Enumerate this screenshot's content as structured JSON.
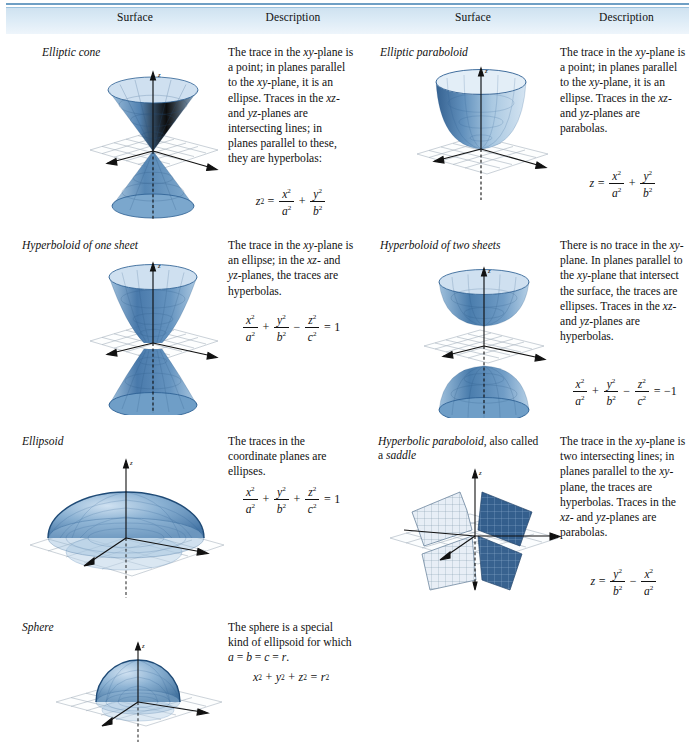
{
  "table": {
    "headers": [
      "Surface",
      "Description",
      "Surface",
      "Description"
    ],
    "rows": [
      {
        "left": {
          "surface_name": "Elliptic cone",
          "figure": "elliptic-cone",
          "description": "The trace in the xy-plane is a point; in planes parallel to the xy-plane, it is an ellipse. Traces in the xz- and yz-planes are intersecting lines; in planes parallel to these, they are hyperbolas:",
          "equation_text": "z² = x²/a² + y²/b²"
        },
        "right": {
          "surface_name": "Elliptic paraboloid",
          "figure": "elliptic-paraboloid",
          "description": "The trace in the xy-plane is a point; in planes parallel to the xy-plane, it is an ellipse. Traces in the xz- and yz-planes are parabolas.",
          "equation_text": "z = x²/a² + y²/b²"
        }
      },
      {
        "left": {
          "surface_name": "Hyperboloid of one sheet",
          "figure": "hyperboloid-one-sheet",
          "description": "The trace in the xy-plane is an ellipse; in the xz- and yz-planes, the traces are hyperbolas.",
          "equation_text": "x²/a² + y²/b² − z²/c² = 1"
        },
        "right": {
          "surface_name": "Hyperboloid of two sheets",
          "figure": "hyperboloid-two-sheets",
          "description": "There is no trace in the xy-plane. In planes parallel to the xy-plane that intersect the surface, the traces are ellipses. Traces in the xz- and yz-planes are hyperbolas.",
          "equation_text": "x²/a² + y²/b² − z²/c² = −1"
        }
      },
      {
        "left": {
          "surface_name": "Ellipsoid",
          "figure": "ellipsoid",
          "description": "The traces in the coordinate planes are ellipses.",
          "equation_text": "x²/a² + y²/b² + z²/c² = 1"
        },
        "right": {
          "surface_name": "Hyperbolic paraboloid, also called a saddle",
          "surface_name_italic": "Hyperbolic paraboloid",
          "surface_name_roman": ", also called",
          "surface_name_line2_roman": "a ",
          "surface_name_line2_italic": "saddle",
          "figure": "hyperbolic-paraboloid",
          "description": "The trace in the xy-plane is two intersecting lines; in planes parallel to the xy-plane, the traces are hyperbolas. Traces in the xz- and yz-planes are parabolas.",
          "equation_text": "z = y²/b² − x²/a²"
        }
      },
      {
        "left": {
          "surface_name": "Sphere",
          "figure": "sphere",
          "description": "The sphere is a special kind of ellipsoid for which a = b = c = r.",
          "equation_text": "x² + y² + z² = r²"
        }
      }
    ]
  },
  "desc_lines": {
    "elliptic_cone": [
      "The trace in the ",
      "xy-",
      "plane is a point; in",
      "planes parallel to the",
      "xy-plane, it is an ellipse.",
      "Traces in the ",
      "xz-",
      " and ",
      "yz-",
      "planes are intersecting",
      "lines; in planes parallel",
      "to these, they are",
      "hyperbolas:"
    ]
  },
  "axis_labels": {
    "x": "x",
    "y": "y",
    "z": "z"
  },
  "colors": {
    "header_gradient_top": "#cfe2f0",
    "header_gradient_bottom": "#eef5fb",
    "header_rule": "#6f9fc4",
    "surface_fill_dark": "#2e5f94",
    "surface_fill_mid": "#6d9dc7",
    "surface_fill_light": "#b9d2e8",
    "grid_line": "#9aa7b4",
    "axis": "#111111",
    "text": "#111111"
  }
}
